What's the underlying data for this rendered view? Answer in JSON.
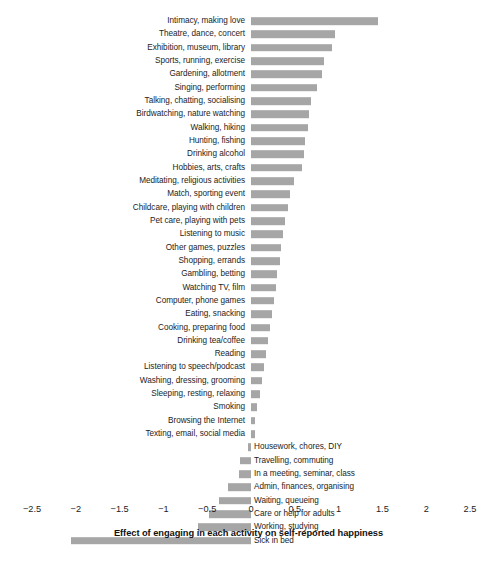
{
  "chart_data": {
    "type": "bar",
    "orientation": "horizontal",
    "title": "",
    "subtitle": "",
    "xlabel": "Effect of engaging in each activity on self-reported happiness",
    "ylabel": "",
    "xlim": [
      -2.75,
      2.75
    ],
    "xticks": [
      "−2.5",
      "−2",
      "−1.5",
      "−1",
      "−0.5",
      "0",
      "0.5",
      "1",
      "1.5",
      "2",
      "2.5"
    ],
    "xtick_values": [
      -2.5,
      -2,
      -1.5,
      -1,
      -0.5,
      0,
      0.5,
      1,
      1.5,
      2,
      2.5
    ],
    "grid": false,
    "legend": null,
    "bar_color": "#a6a6a6",
    "categories": [
      "Intimacy, making love",
      "Theatre, dance, concert",
      "Exhibition, museum, library",
      "Sports, running, exercise",
      "Gardening, allotment",
      "Singing, performing",
      "Talking, chatting, socialising",
      "Birdwatching, nature watching",
      "Walking, hiking",
      "Hunting, fishing",
      "Drinking alcohol",
      "Hobbies, arts, crafts",
      "Meditating, religious activities",
      "Match, sporting event",
      "Childcare, playing with children",
      "Pet care, playing with pets",
      "Listening to music",
      "Other games, puzzles",
      "Shopping, errands",
      "Gambling, betting",
      "Watching TV, film",
      "Computer, phone games",
      "Eating, snacking",
      "Cooking, preparing food",
      "Drinking tea/coffee",
      "Reading",
      "Listening to speech/podcast",
      "Washing, dressing, grooming",
      "Sleeping, resting, relaxing",
      "Smoking",
      "Browsing the Internet",
      "Texting, email, social media",
      "Housework, chores, DIY",
      "Travelling, commuting",
      "In  a meeting, seminar, class",
      "Admin, finances, organising",
      "Waiting, queueing",
      "Care  or  help for adults",
      "Working, studying",
      "Sick in bed"
    ],
    "values": [
      1.45,
      0.96,
      0.92,
      0.83,
      0.81,
      0.75,
      0.68,
      0.66,
      0.65,
      0.62,
      0.6,
      0.58,
      0.49,
      0.45,
      0.42,
      0.39,
      0.37,
      0.34,
      0.33,
      0.3,
      0.28,
      0.26,
      0.24,
      0.22,
      0.19,
      0.17,
      0.15,
      0.12,
      0.1,
      0.07,
      0.05,
      0.04,
      -0.03,
      -0.12,
      -0.14,
      -0.26,
      -0.36,
      -0.48,
      -0.6,
      -2.05
    ]
  }
}
